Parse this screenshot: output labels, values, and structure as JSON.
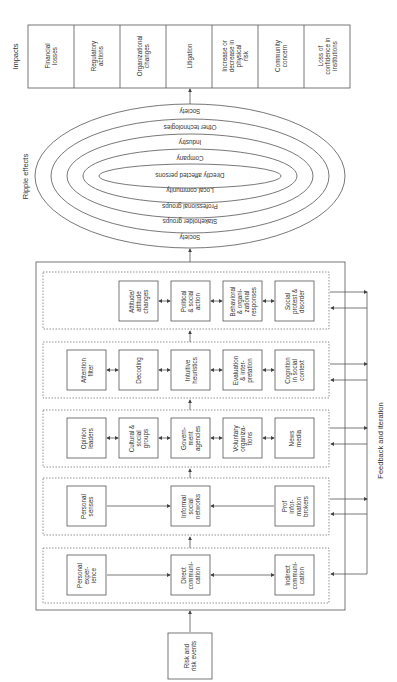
{
  "impacts": {
    "label": "Impacts",
    "items": [
      "Financial\nlosses",
      "Regulatory\nactions",
      "Organizational\nchanges",
      "Litigation",
      "Increase or\ndecrease in\nphysical\nrisk",
      "Community\nconcern",
      "Loss of\nconfidence in\ninstitutions"
    ]
  },
  "ripple": {
    "label": "Ripple effects",
    "rings_top": [
      "Society",
      "Other technologies",
      "Industry",
      "Company"
    ],
    "center": "Directly affected persons",
    "rings_bottom": [
      "Local community",
      "Professional groups",
      "Stakeholder groups",
      "Society"
    ]
  },
  "amplification": {
    "rows": [
      {
        "id": "behavior",
        "boxes": [
          "Attitude/\nattitude\nchanges",
          "Political\n& social\naction",
          "Behavioral\n& organi-\nzational\nresponses",
          "Social\nprotest &\ndisorder"
        ]
      },
      {
        "id": "individual",
        "boxes": [
          "Attention\nfilter",
          "Decoding",
          "Intuitive\nheuristics",
          "Evaluation\n& inter-\npretation",
          "Cognition\nin social\ncontext"
        ]
      },
      {
        "id": "institutional",
        "boxes": [
          "Opinion\nleaders",
          "Cultural &\nsocial\ngroups",
          "Govern-\nment\nagencies",
          "Voluntary\norganiza-\ntions",
          "News\nmedia"
        ]
      },
      {
        "id": "informal",
        "boxes": [
          "Personal\nsenses",
          "Informal\nsocial\nnetworks",
          "Prof\ninfor-\nmation\nbrokers"
        ]
      },
      {
        "id": "source",
        "boxes": [
          "Personal\nexper-\nience",
          "Direct\ncommuni-\ncation",
          "Indirect\ncommuni-\ncation"
        ]
      }
    ]
  },
  "feedback": {
    "label": "Feedback and iteration"
  },
  "source_event": {
    "label": "Risk and\nrisk events"
  },
  "colors": {
    "line": "#555555",
    "text": "#333333",
    "background": "#ffffff"
  }
}
